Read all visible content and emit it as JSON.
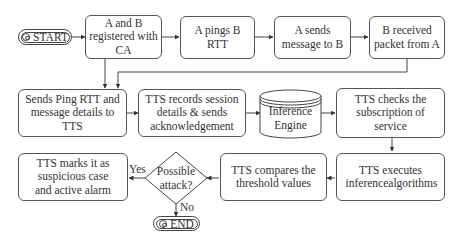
{
  "diagram": {
    "start": {
      "label": "START",
      "icon": "eye-icon"
    },
    "end": {
      "label": "END",
      "icon": "stop-icon"
    },
    "nodes": {
      "registered": "A and B registered with CA",
      "ping": "A pings B RTT",
      "send_msg": "A sends message to B",
      "received": "B received packet from A",
      "send_details": "Sends Ping RTT and message details to TTS",
      "records": "TTS records session details & sends acknowledgement",
      "engine": "Inference Engine",
      "subscription": "TTS checks the subscription of service",
      "executes": "TTS executes inferencealgorithms",
      "compares": "TTS compares the threshold values",
      "decision": "Possible attack?",
      "marks": "TTS marks it as suspicious case and active alarm"
    },
    "edge_labels": {
      "yes": "Yes",
      "no": "No"
    }
  }
}
